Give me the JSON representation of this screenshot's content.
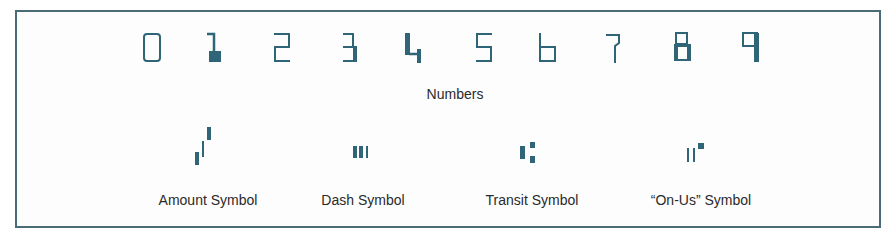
{
  "figure": {
    "ink_color": "#2f6577",
    "numbers_label": "Numbers",
    "digits": [
      {
        "char": "0",
        "name": "digit-0"
      },
      {
        "char": "1",
        "name": "digit-1"
      },
      {
        "char": "2",
        "name": "digit-2"
      },
      {
        "char": "3",
        "name": "digit-3"
      },
      {
        "char": "4",
        "name": "digit-4"
      },
      {
        "char": "5",
        "name": "digit-5"
      },
      {
        "char": "6",
        "name": "digit-6"
      },
      {
        "char": "7",
        "name": "digit-7"
      },
      {
        "char": "8",
        "name": "digit-8"
      },
      {
        "char": "9",
        "name": "digit-9"
      }
    ],
    "symbols": [
      {
        "label": "Amount Symbol",
        "name": "amount-symbol"
      },
      {
        "label": "Dash Symbol",
        "name": "dash-symbol"
      },
      {
        "label": "Transit Symbol",
        "name": "transit-symbol"
      },
      {
        "label": "“On-Us” Symbol",
        "name": "on-us-symbol"
      }
    ]
  }
}
